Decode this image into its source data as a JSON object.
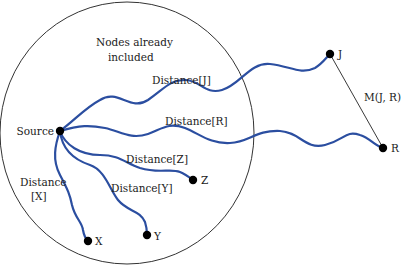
{
  "region": {
    "label_line1": "Nodes already",
    "label_line2": "included"
  },
  "nodes": {
    "source": "Source",
    "j": "J",
    "r": "R",
    "z": "Z",
    "y": "Y",
    "x": "X"
  },
  "edges": {
    "distance_j": "Distance[J]",
    "distance_r": "Distance[R]",
    "distance_z": "Distance[Z]",
    "distance_y": "Distance[Y]",
    "distance_x_line1": "Distance",
    "distance_x_line2": "[X]",
    "m_jr": "M(J, R)"
  },
  "colors": {
    "path": "#2b4ea0",
    "node": "#000000",
    "circle": "#333333"
  }
}
